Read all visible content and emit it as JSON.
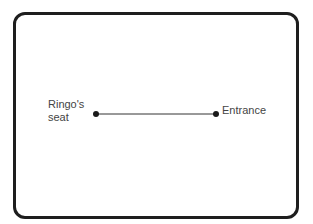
{
  "diagram": {
    "nodes": [
      {
        "id": "ringos-seat",
        "label_line1": "Ringo's",
        "label_line2": "seat"
      },
      {
        "id": "entrance",
        "label": "Entrance"
      }
    ],
    "edges": [
      {
        "from": "ringos-seat",
        "to": "entrance"
      }
    ],
    "colors": {
      "frame": "#1e1e1e",
      "line": "#333333",
      "text": "#444444"
    }
  }
}
